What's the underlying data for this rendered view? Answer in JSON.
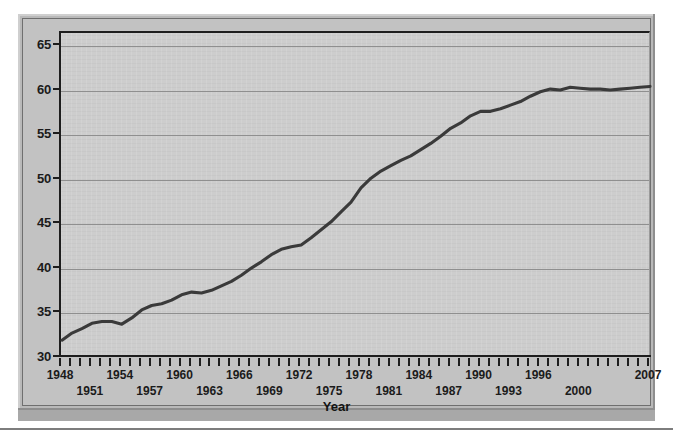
{
  "figure": {
    "kind": "statistical-line-chart",
    "frame_color": "#b9b9b9",
    "plot_background": "#cdcdcd",
    "line_color": "#3a3a3a"
  },
  "chart_data": {
    "type": "line",
    "title": "",
    "xlabel": "Year",
    "ylabel": "Percent of women in workforce",
    "xlim": [
      1948,
      2007
    ],
    "ylim": [
      30,
      66.5
    ],
    "yticks": [
      30,
      35,
      40,
      45,
      50,
      55,
      60,
      65
    ],
    "grid": "horizontal",
    "legend": "none",
    "xtick_interval": 1,
    "xtick_labels_row_top": [
      1948,
      1954,
      1960,
      1966,
      1972,
      1978,
      1984,
      1990,
      1996,
      2007
    ],
    "xtick_labels_row_bottom": [
      1951,
      1957,
      1963,
      1969,
      1975,
      1981,
      1987,
      1993,
      2000
    ],
    "x": [
      1948,
      1949,
      1950,
      1951,
      1952,
      1953,
      1954,
      1955,
      1956,
      1957,
      1958,
      1959,
      1960,
      1961,
      1962,
      1963,
      1964,
      1965,
      1966,
      1967,
      1968,
      1969,
      1970,
      1971,
      1972,
      1973,
      1974,
      1975,
      1976,
      1977,
      1978,
      1979,
      1980,
      1981,
      1982,
      1983,
      1984,
      1985,
      1986,
      1987,
      1988,
      1989,
      1990,
      1991,
      1992,
      1993,
      1994,
      1995,
      1996,
      1997,
      1998,
      1999,
      2000,
      2001,
      2002,
      2003,
      2004,
      2005,
      2006,
      2007
    ],
    "values": [
      32.0,
      32.8,
      33.3,
      33.9,
      34.1,
      34.1,
      33.8,
      34.5,
      35.4,
      35.9,
      36.1,
      36.5,
      37.1,
      37.4,
      37.3,
      37.6,
      38.1,
      38.6,
      39.3,
      40.1,
      40.8,
      41.6,
      42.2,
      42.5,
      42.7,
      43.5,
      44.4,
      45.3,
      46.4,
      47.5,
      49.1,
      50.2,
      51.0,
      51.6,
      52.2,
      52.7,
      53.4,
      54.1,
      54.9,
      55.8,
      56.4,
      57.2,
      57.7,
      57.7,
      58.0,
      58.4,
      58.8,
      59.4,
      59.9,
      60.2,
      60.1,
      60.4,
      60.3,
      60.2,
      60.2,
      60.1,
      60.2,
      60.3,
      60.4,
      60.5
    ],
    "series_name": "Percent of women in workforce"
  }
}
